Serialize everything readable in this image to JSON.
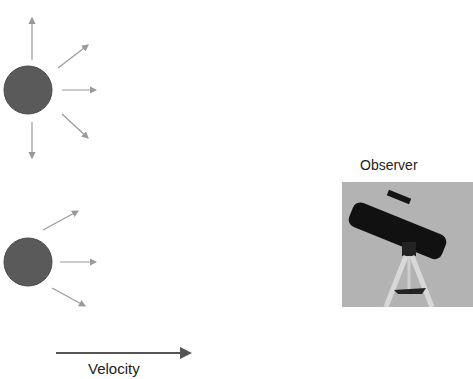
{
  "diagram": {
    "title": "",
    "observer_label": "Observer",
    "velocity_label": "Velocity",
    "colors": {
      "source_fill": "#5a5a5a",
      "wave_arrow": "#9a9a9a",
      "velocity_arrow": "#555555",
      "photo_background": "#b3b3b3"
    },
    "nodes": [
      {
        "id": "stationary-source",
        "shape": "circle",
        "emits_arrows": 6
      },
      {
        "id": "moving-source",
        "shape": "circle",
        "emits_arrows": 3
      },
      {
        "id": "observer",
        "shape": "photo",
        "depicts": "telescope on tripod"
      }
    ]
  }
}
